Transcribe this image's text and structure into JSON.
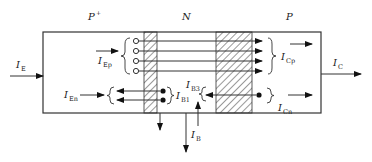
{
  "diagram": {
    "regions": [
      {
        "name": "emitter",
        "label": "P",
        "sup": "+"
      },
      {
        "name": "base",
        "label": "N"
      },
      {
        "name": "collector",
        "label": "P"
      }
    ],
    "currents": {
      "IE": {
        "main": "I",
        "sub": "E"
      },
      "IEp": {
        "main": "I",
        "sub": "Ep"
      },
      "IEn": {
        "main": "I",
        "sub": "En"
      },
      "IB1": {
        "main": "I",
        "sub": "B1"
      },
      "IB3": {
        "main": "I",
        "sub": "B3"
      },
      "IB": {
        "main": "I",
        "sub": "B"
      },
      "ICp": {
        "main": "I",
        "sub": "Cp"
      },
      "ICn": {
        "main": "I",
        "sub": "Cn"
      },
      "IC": {
        "main": "I",
        "sub": "C"
      }
    },
    "colors": {
      "stroke": "#333333",
      "fill": "#111111",
      "background": "#ffffff"
    }
  }
}
